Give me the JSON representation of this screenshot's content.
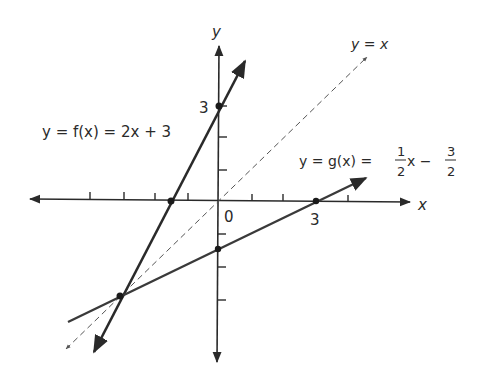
{
  "diagram": {
    "axes": {
      "x_label": "x",
      "y_label": "y",
      "origin_label": "0",
      "x_tick_label": "3",
      "y_tick_label": "3",
      "x_ticks": [
        -4,
        -3,
        -2,
        -1,
        1,
        2,
        3,
        4
      ],
      "y_ticks": [
        -3,
        -2,
        -1,
        1,
        2,
        3
      ]
    },
    "lines": [
      {
        "name": "f",
        "equation": "y = f(x) = 2x + 3",
        "label_prefix": "y = f(x) = 2x + 3",
        "style": "solid",
        "color": "#2a2a2a",
        "points_marked": [
          [
            0,
            3
          ],
          [
            -1.5,
            0
          ],
          [
            -3,
            -3
          ]
        ]
      },
      {
        "name": "g",
        "equation": "y = g(x) = 1/2 x - 3/2",
        "label_prefix": "y = g(x) =",
        "frac1_num": "1",
        "frac1_den": "2",
        "mid": "x −",
        "frac2_num": "3",
        "frac2_den": "2",
        "style": "solid",
        "color": "#3a3a3a",
        "points_marked": [
          [
            3,
            0
          ],
          [
            0,
            -1.5
          ],
          [
            -3,
            -3
          ]
        ]
      },
      {
        "name": "identity",
        "equation": "y = x",
        "label": "y = x",
        "style": "dashed",
        "color": "#555555"
      }
    ],
    "intersection": {
      "x": -3,
      "y": -3
    }
  }
}
